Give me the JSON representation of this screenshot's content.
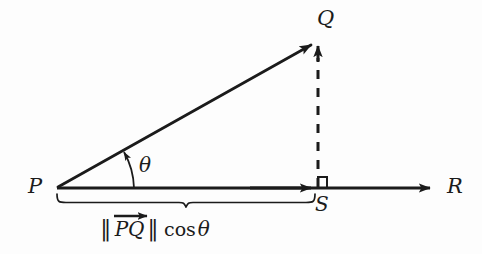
{
  "figure": {
    "background_color": "#fdfdfd",
    "ink_color": "#1b1b1b",
    "labels": {
      "point_p": "P",
      "point_q": "Q",
      "point_r": "R",
      "point_s": "S",
      "angle": "θ"
    },
    "caption": {
      "norm_open": "‖",
      "vector_name": "PQ",
      "norm_close": "‖",
      "function": "cos",
      "angle": "θ",
      "full_text": "‖ PQ→ ‖ cos θ"
    },
    "geometry": {
      "p": [
        57,
        188
      ],
      "q": [
        317,
        42
      ],
      "s": [
        318,
        188
      ],
      "r_arrow_tip": [
        437,
        188
      ],
      "right_angle_marker": [
        317,
        177,
        10,
        10
      ],
      "brace_left": 57,
      "brace_right": 315,
      "brace_peak_x": 186,
      "angle_arc_radius": 68,
      "angle_degrees": 29
    }
  }
}
